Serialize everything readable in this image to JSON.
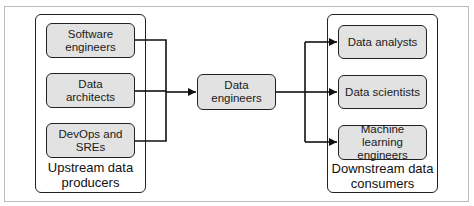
{
  "diagram": {
    "upstream": {
      "label": "Upstream data producers",
      "label_line1": "Upstream data",
      "label_line2": "producers",
      "nodes": [
        {
          "line1": "Software",
          "line2": "engineers"
        },
        {
          "line1": "Data",
          "line2": "architects"
        },
        {
          "line1": "DevOps and",
          "line2": "SREs"
        }
      ]
    },
    "center": {
      "line1": "Data",
      "line2": "engineers"
    },
    "downstream": {
      "label": "Downstream data consumers",
      "label_line1": "Downstream data",
      "label_line2": "consumers",
      "nodes": [
        {
          "line1": "Data analysts",
          "line2": ""
        },
        {
          "line1": "Data scientists",
          "line2": ""
        },
        {
          "line1": "Machine learning",
          "line2": "engineers"
        }
      ]
    },
    "colors": {
      "node_fill": "#e2e2e2",
      "stroke": "#222222",
      "frame": "#bdbdbd"
    },
    "edges": [
      {
        "from": "Software engineers",
        "to": "Data engineers"
      },
      {
        "from": "Data architects",
        "to": "Data engineers"
      },
      {
        "from": "DevOps and SREs",
        "to": "Data engineers"
      },
      {
        "from": "Data engineers",
        "to": "Data analysts"
      },
      {
        "from": "Data engineers",
        "to": "Data scientists"
      },
      {
        "from": "Data engineers",
        "to": "Machine learning engineers"
      }
    ]
  }
}
